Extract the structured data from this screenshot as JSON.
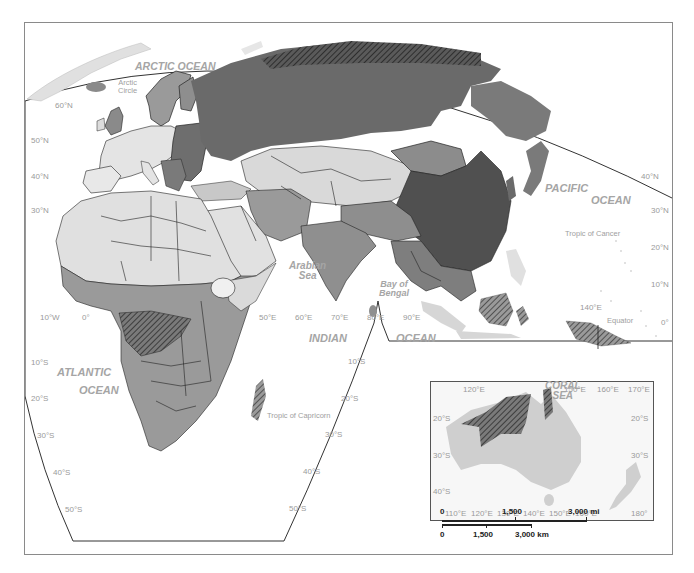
{
  "map": {
    "title": "Map of Eastern Hemisphere (Eurasia, Africa, Australia)",
    "colors": {
      "ocean": "#ffffff",
      "land_lightest": "#e6e6e6",
      "land_light": "#cfcfcf",
      "land_mid": "#9a9a9a",
      "land_dark": "#6e6e6e",
      "land_darkest": "#4f4f4f",
      "border": "#222222",
      "hatch": "#333333",
      "label_gray": "#9a9a9a",
      "frame": "#8a8a8a"
    },
    "water_labels": {
      "arctic_ocean": "ARCTIC OCEAN",
      "pacific_ocean_1": "PACIFIC",
      "pacific_ocean_2": "OCEAN",
      "atlantic_ocean_1": "ATLANTIC",
      "atlantic_ocean_2": "OCEAN",
      "indian_ocean_1": "INDIAN",
      "indian_ocean_2": "OCEAN",
      "arabian_sea_1": "Arabian",
      "arabian_sea_2": "Sea",
      "bay_of_bengal_1": "Bay of",
      "bay_of_bengal_2": "Bengal",
      "coral_sea_1": "CORAL",
      "coral_sea_2": "SEA"
    },
    "reference_lines": {
      "arctic_circle_1": "Arctic",
      "arctic_circle_2": "Circle",
      "tropic_of_cancer": "Tropic of Cancer",
      "tropic_of_capricorn": "Tropic of Capricorn",
      "equator": "Equator"
    },
    "latitude_labels_left": [
      "60°N",
      "50°N",
      "40°N",
      "30°N",
      "10°S",
      "20°S",
      "30°S",
      "40°S",
      "50°S"
    ],
    "latitude_labels_right": [
      "40°N",
      "30°N",
      "20°N",
      "10°N",
      "0°"
    ],
    "latitude_labels_indian": [
      "10°S",
      "20°S",
      "30°S",
      "40°S",
      "50°S"
    ],
    "longitude_labels": [
      "10°W",
      "0°",
      "50°E",
      "60°E",
      "70°E",
      "80°E",
      "90°E",
      "140°E"
    ]
  },
  "inset": {
    "name": "Australia inset",
    "top_labels": [
      "120°E",
      "150°E",
      "160°E",
      "170°E"
    ],
    "bottom_labels": [
      "110°E",
      "120°E",
      "130°E",
      "140°E",
      "150°E",
      "160°E",
      "180°"
    ],
    "left_labels": [
      "20°S",
      "30°S",
      "40°S"
    ],
    "right_labels": [
      "20°S",
      "30°S"
    ]
  },
  "scale_bar": {
    "miles": [
      "0",
      "1,500",
      "3,000 mi"
    ],
    "km": [
      "0",
      "1,500",
      "3,000 km"
    ]
  }
}
